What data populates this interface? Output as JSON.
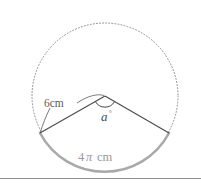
{
  "figure": {
    "kind": "circle-sector-diagram",
    "labels": {
      "radius": "6cm",
      "angle_letter": "a",
      "angle_degree_symbol": "°",
      "arc_length_number": "4",
      "arc_length_pi": "π",
      "arc_length_unit": "cm"
    },
    "colors": {
      "background": "#ffffff",
      "dotted_circle": "#8c8c94",
      "sector_radius_line": "#4a4a4a",
      "sector_arc": "#a9a9a9",
      "angle_arc": "#4a4a4a",
      "leader_line": "#6a6a6a",
      "divider": "#8f8f8f",
      "radius_label": "#5c5c5c",
      "angle_label": "#4a4a4a",
      "arc_label": "#9a9a9a"
    },
    "geometry": {
      "center_x": 105,
      "center_y": 96,
      "circle_radius": 73,
      "left_endpoint_x": 40,
      "left_endpoint_y": 133,
      "right_endpoint_x": 169,
      "right_endpoint_y": 133,
      "arc_bottom_x": 105,
      "arc_bottom_y": 169,
      "angle_arc_radius": 11,
      "divider_y": 178
    }
  }
}
